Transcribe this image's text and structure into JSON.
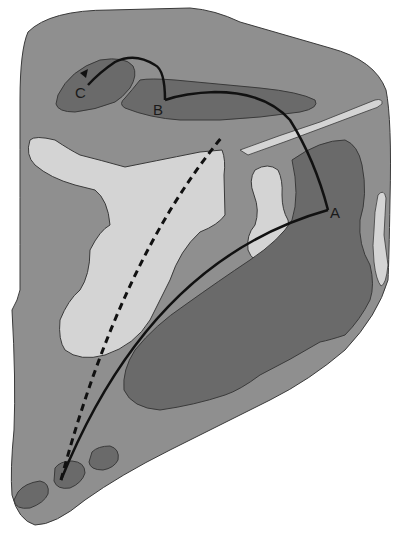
{
  "diagram": {
    "type": "anatomical-cross-section",
    "colors": {
      "background": "#ffffff",
      "outer_region": "#8f8f8f",
      "dark_region": "#6a6a6a",
      "light_region": "#d4d4d4",
      "outline": "#3a3a3a",
      "path_line": "#111111"
    },
    "labels": {
      "A": "A",
      "B": "B",
      "C": "C"
    },
    "paths": [
      {
        "name": "solid-path-to-A",
        "style": "solid",
        "from": "bottom-left-node",
        "to": "A"
      },
      {
        "name": "solid-path-A-to-B",
        "style": "solid",
        "from": "A",
        "to": "B"
      },
      {
        "name": "solid-path-B-to-C",
        "style": "solid",
        "from": "B",
        "to": "C",
        "arrowhead": true
      },
      {
        "name": "dashed-path",
        "style": "dashed",
        "from": "bottom-left-node",
        "to": "upper-middle"
      }
    ]
  }
}
